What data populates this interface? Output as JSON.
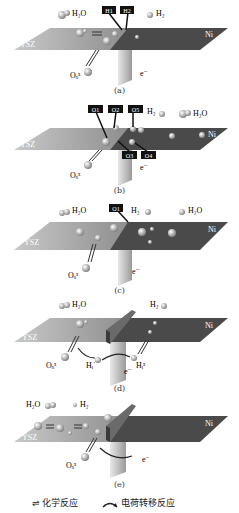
{
  "figure": {
    "panels": [
      {
        "id": "a",
        "caption": "(a)",
        "left_plane": "YSZ",
        "right_plane": "Ni",
        "labels": {
          "h2o": "H₂O",
          "h2": "H₂",
          "oxide": "Oₒˣ",
          "electron": "e⁻"
        },
        "boxed_tags": [
          "H1",
          "H2"
        ]
      },
      {
        "id": "b",
        "caption": "(b)",
        "left_plane": "YSZ",
        "right_plane": "Ni",
        "labels": {
          "h2o": "H₂O",
          "h2": "H₂",
          "oxide": "Oₒˣ",
          "electron": "e⁻"
        },
        "boxed_tags": [
          "O1",
          "O2",
          "O5",
          "O3",
          "O4"
        ]
      },
      {
        "id": "c",
        "caption": "(c)",
        "left_plane": "YSZ",
        "right_plane": "Ni",
        "labels": {
          "h2o_left": "H₂O",
          "h2": "H₂",
          "h2o_right": "H₂O",
          "oxide": "Oₒˣ",
          "electron": "e⁻"
        },
        "boxed_tags": [
          "O1"
        ]
      },
      {
        "id": "d",
        "caption": "(d)",
        "left_plane": "YSZ",
        "right_plane": "Ni",
        "labels": {
          "h2o": "H₂O",
          "h2": "H₂",
          "oxide": "Oₒˣ",
          "hi_left": "Hᵢ˙",
          "hi_right": "Hᵢˣ",
          "electron": "e⁻"
        }
      },
      {
        "id": "e",
        "caption": "(e)",
        "left_plane": "YSZ",
        "right_plane": "Ni",
        "labels": {
          "h2o": "H₂O",
          "h2": "H₂",
          "oxide": "Oₒˣ",
          "electron": "e⁻"
        }
      }
    ],
    "legend": {
      "chemical": {
        "symbol": "⇌",
        "label": "化学反应"
      },
      "charge_transfer": {
        "symbol": "⁀",
        "label": "电荷转移反应"
      }
    },
    "colors": {
      "ysz_plane": "#a9a9a9",
      "ni_plane": "#4a4a4a",
      "wedge": "#b8b8b8",
      "atom": "#9a9a9a",
      "tag_bg": "#111111",
      "tag_fg": "#ffffff"
    }
  }
}
